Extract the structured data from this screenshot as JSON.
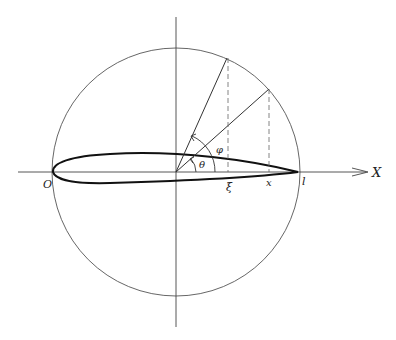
{
  "diagram": {
    "type": "thin-airfoil-circle-mapping",
    "labels": {
      "origin": "O",
      "chord_end": "l",
      "x_axis": "X",
      "xi": "ξ",
      "x_point": "x",
      "theta": "θ",
      "phi": "φ"
    },
    "geometry": {
      "center": [
        176,
        172
      ],
      "radius": 124,
      "chord": {
        "start": [
          53,
          172
        ],
        "end": [
          298,
          172
        ]
      }
    },
    "colors": {
      "ink": "#222222",
      "thin_line": "#555555",
      "background": "#ffffff"
    }
  }
}
